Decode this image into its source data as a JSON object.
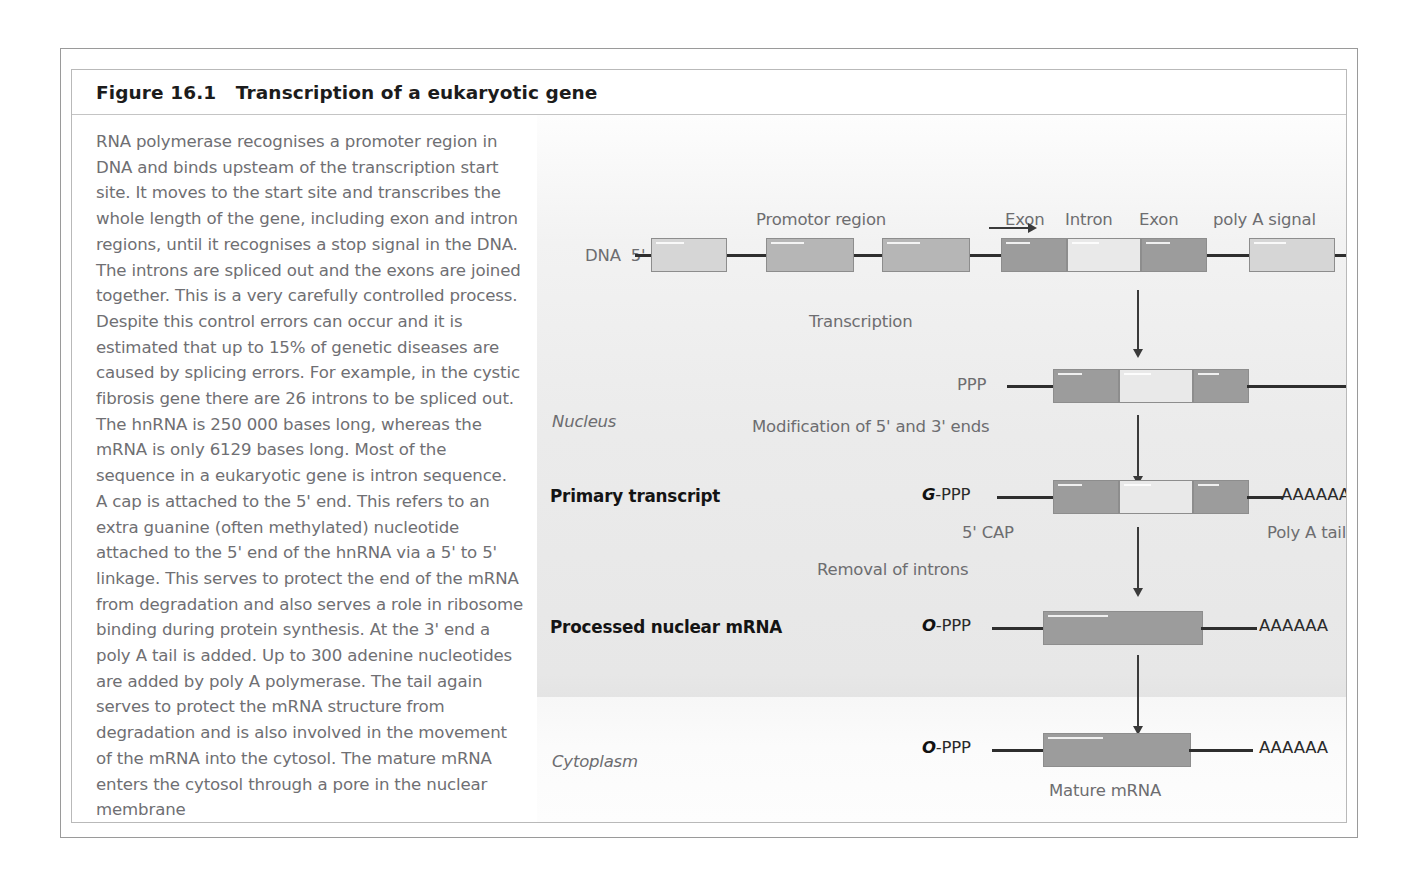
{
  "figure": {
    "title": "Figure 16.1   Transcription of a eukaryotic gene"
  },
  "caption": {
    "lines": [
      "RNA polymerase recognises a promoter region in",
      "DNA and binds upsteam of the transcription start",
      "site. It moves to the start site and transcribes the",
      "whole length of the gene, including exon and intron",
      "regions, until it recognises a stop signal in the DNA.",
      "The introns are spliced out and the exons are joined",
      "together. This is a very carefully controlled process.",
      "Despite this control errors can occur and it is",
      "estimated that up to 15% of genetic diseases are",
      "caused by splicing errors. For example, in the cystic",
      "fibrosis gene there are 26 introns to be spliced out.",
      "The hnRNA is 250 000 bases long, whereas the",
      "mRNA is only 6129 bases long. Most of the",
      "sequence in a eukaryotic gene is intron sequence.",
      "A cap is attached to the 5' end. This refers to an",
      "extra guanine (often methylated) nucleotide",
      "attached to the 5' end of the hnRNA via a 5' to 5'",
      "linkage. This serves to protect the end of the mRNA",
      "from degradation and also serves a role in ribosome",
      "binding during protein synthesis. At the 3' end a",
      "poly A tail is added. Up to 300 adenine nucleotides",
      "are added by poly A polymerase. The tail again",
      "serves to protect the mRNA structure from",
      "degradation and is also involved in the movement",
      "of the mRNA into the cytosol. The mature mRNA",
      "enters the cytosol through a pore in the nuclear",
      "membrane"
    ]
  },
  "diagram": {
    "compartments": {
      "nucleus": "Nucleus",
      "cytoplasm": "Cytoplasm"
    },
    "dna_row": {
      "strand_label": "DNA  5'",
      "promoter_label": "Promotor region",
      "exon1_label": "Exon",
      "intron_label": "Intron",
      "exon2_label": "Exon",
      "polya_signal_label": "poly A signal"
    },
    "steps": {
      "transcription": "Transcription",
      "modification": "Modification of 5' and 3' ends",
      "removal": "Removal of introns"
    },
    "transcript_rows": [
      {
        "name": "hnrna-row",
        "row_label": "",
        "five_prime": "PPP",
        "three_prime": ""
      },
      {
        "name": "primary-transcript-row",
        "row_label": "Primary transcript",
        "cap_prefix": "G",
        "five_prime": "-PPP",
        "three_prime": "AAAAAA",
        "cap_note": "5' CAP",
        "tail_note": "Poly A tail"
      },
      {
        "name": "processed-nuclear-mrna-row",
        "row_label": "Processed nuclear mRNA",
        "cap_prefix": "O",
        "five_prime": "-PPP",
        "three_prime": "AAAAAA"
      },
      {
        "name": "mature-mrna-row",
        "row_label": "",
        "cap_prefix": "O",
        "five_prime": "-PPP",
        "three_prime": "AAAAAA",
        "caption": "Mature mRNA"
      }
    ]
  },
  "colors": {
    "exon": "#9c9c9c",
    "intron": "#e9e9e9",
    "promoter_box": "#b6b6b6",
    "upstream_box": "#d6d6d6",
    "text_gray": "#6f6f73",
    "text_dark": "#141414",
    "strand_line": "#2e2e2e"
  }
}
